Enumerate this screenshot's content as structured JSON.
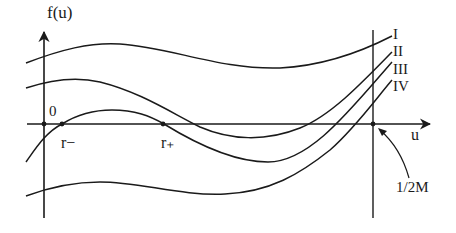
{
  "diagram": {
    "axis_y_label": "f(u)",
    "axis_x_label": "u",
    "origin_label": "0",
    "roots": [
      {
        "label": "r−",
        "name": "r-minus"
      },
      {
        "label": "r₊",
        "name": "r-plus"
      }
    ],
    "curves": [
      {
        "label": "I"
      },
      {
        "label": "II"
      },
      {
        "label": "III"
      },
      {
        "label": "IV"
      }
    ],
    "vertical_marker_label": "1/2M",
    "colors": {
      "ink": "#1a1a1a",
      "background": "#ffffff"
    }
  }
}
